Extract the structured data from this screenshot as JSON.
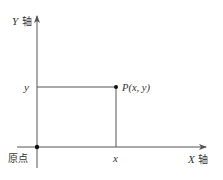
{
  "diagram": {
    "type": "cartesian-coordinate-plane",
    "colors": {
      "axis": "#555555",
      "guide": "#555555",
      "point": "#111111",
      "text": "#333333"
    },
    "y_axis": {
      "label_var": "Y",
      "label_word": "轴"
    },
    "x_axis": {
      "label_var": "X",
      "label_word": "轴"
    },
    "origin": {
      "label": "原点"
    },
    "point": {
      "label": "P(x, y)"
    },
    "ticks": {
      "x": "x",
      "y": "y"
    }
  }
}
